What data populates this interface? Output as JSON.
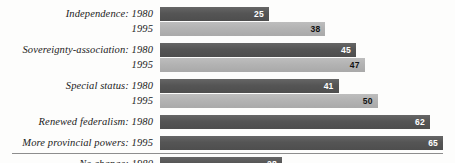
{
  "chart_data": {
    "type": "bar",
    "orientation": "horizontal",
    "title": "",
    "subtitle": "",
    "xlabel": "",
    "ylabel": "",
    "xlim": [
      0,
      65
    ],
    "grid": false,
    "legend": "none",
    "value_suffix": "",
    "series": [
      {
        "name": "1980",
        "color": "#555555"
      },
      {
        "name": "1995",
        "color": "#b2b2b2"
      }
    ],
    "categories": [
      "Independence",
      "Sovereignty-association",
      "Special status",
      "Renewed federalism",
      "More provincial powers",
      "No change"
    ],
    "groups": [
      {
        "category": "Independence",
        "rows": [
          {
            "year": "1980",
            "value": 25,
            "series": "1980"
          },
          {
            "year": "1995",
            "value": 38,
            "series": "1995"
          }
        ]
      },
      {
        "category": "Sovereignty-association",
        "rows": [
          {
            "year": "1980",
            "value": 45,
            "series": "1980"
          },
          {
            "year": "1995",
            "value": 47,
            "series": "1995"
          }
        ]
      },
      {
        "category": "Special status",
        "rows": [
          {
            "year": "1980",
            "value": 41,
            "series": "1980"
          },
          {
            "year": "1995",
            "value": 50,
            "series": "1995"
          }
        ]
      },
      {
        "category": "Renewed federalism",
        "rows": [
          {
            "year": "1980",
            "value": 62,
            "series": "1980"
          }
        ]
      },
      {
        "category": "More provincial powers",
        "rows": [
          {
            "year": "1995",
            "value": 65,
            "series": "1980"
          }
        ]
      },
      {
        "category": "No change",
        "rows": [
          {
            "year": "1980",
            "value": 28,
            "series": "1980"
          },
          {
            "year": "1995",
            "value": 19,
            "series": "1995"
          }
        ]
      }
    ]
  },
  "rows": [
    {
      "label": "Independence:",
      "year": "1980",
      "value": "25",
      "series": "1980"
    },
    {
      "label": "",
      "year": "1995",
      "value": "38",
      "series": "1995"
    },
    {
      "label": "Sovereignty-association:",
      "year": "1980",
      "value": "45",
      "series": "1980"
    },
    {
      "label": "",
      "year": "1995",
      "value": "47",
      "series": "1995"
    },
    {
      "label": "Special status:",
      "year": "1980",
      "value": "41",
      "series": "1980"
    },
    {
      "label": "",
      "year": "1995",
      "value": "50",
      "series": "1995"
    },
    {
      "label": "Renewed federalism:",
      "year": "1980",
      "value": "62",
      "series": "1980"
    },
    {
      "label": "More provincial powers:",
      "year": "1995",
      "value": "65",
      "series": "1980"
    },
    {
      "label": "No change:",
      "year": "1980",
      "value": "28",
      "series": "1980"
    },
    {
      "label": "",
      "year": "1995",
      "value": "19",
      "series": "1995"
    }
  ],
  "colors": {
    "bar_1980": "#555555",
    "bar_1995": "#b2b2b2",
    "label_text": "#1b1b1b",
    "value_on_dark": "#ffffff",
    "value_on_light": "#111111",
    "rule": "#8d8d8d",
    "background": "#fdfdfc"
  }
}
